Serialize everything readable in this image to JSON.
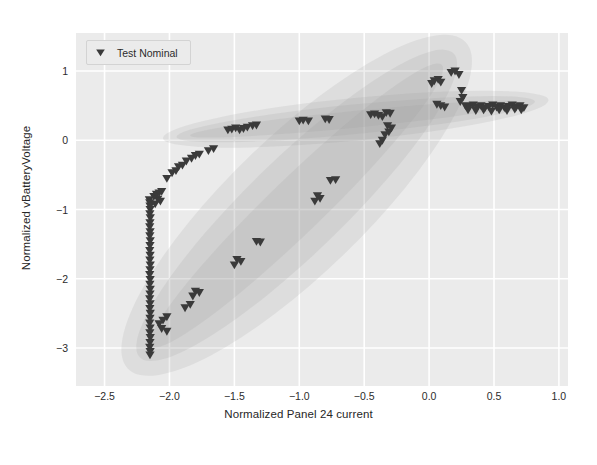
{
  "figure": {
    "background": "#ffffff",
    "plot_background": "#ebebeb",
    "grid_color": "#ffffff",
    "marker_color": "#3a3a3a",
    "band_color": "#9a9a9a"
  },
  "legend": {
    "position": "upper-left",
    "entries": [
      {
        "label": "Test Nominal",
        "marker": "triangle-down-marker",
        "color": "#3a3a3a"
      }
    ]
  },
  "chart_data": {
    "type": "scatter",
    "title": "",
    "xlabel": "Normalized Panel 24 current",
    "ylabel": "Normalized vBatteryVoltage",
    "xlim": [
      -2.72,
      1.07
    ],
    "ylim": [
      -3.55,
      1.55
    ],
    "xticks": [
      -2.5,
      -2.0,
      -1.5,
      -1.0,
      -0.5,
      0.0,
      0.5,
      1.0
    ],
    "xticklabels": [
      "-2.5",
      "-2.0",
      "-1.5",
      "-1.0",
      "-0.5",
      "0.0",
      "0.5",
      "1.0"
    ],
    "yticks": [
      1,
      0,
      -1,
      -2,
      -3
    ],
    "yticklabels": [
      "1",
      "0",
      "-1",
      "-2",
      "-3"
    ],
    "grid": true,
    "legend_position": "upper left",
    "series": [
      {
        "name": "Test Nominal",
        "marker": "triangle-down",
        "color": "#3a3a3a",
        "points": [
          [
            -2.155,
            -0.86
          ],
          [
            -2.152,
            -0.9
          ],
          [
            -2.15,
            -0.95
          ],
          [
            -2.149,
            -1.0
          ],
          [
            -2.151,
            -1.06
          ],
          [
            -2.148,
            -1.12
          ],
          [
            -2.15,
            -1.19
          ],
          [
            -2.152,
            -1.25
          ],
          [
            -2.149,
            -1.32
          ],
          [
            -2.151,
            -1.38
          ],
          [
            -2.148,
            -1.45
          ],
          [
            -2.15,
            -1.52
          ],
          [
            -2.152,
            -1.59
          ],
          [
            -2.149,
            -1.66
          ],
          [
            -2.151,
            -1.73
          ],
          [
            -2.148,
            -1.8
          ],
          [
            -2.15,
            -1.87
          ],
          [
            -2.152,
            -1.94
          ],
          [
            -2.149,
            -2.01
          ],
          [
            -2.151,
            -2.08
          ],
          [
            -2.148,
            -2.15
          ],
          [
            -2.15,
            -2.22
          ],
          [
            -2.152,
            -2.29
          ],
          [
            -2.149,
            -2.36
          ],
          [
            -2.151,
            -2.43
          ],
          [
            -2.148,
            -2.5
          ],
          [
            -2.15,
            -2.57
          ],
          [
            -2.152,
            -2.64
          ],
          [
            -2.149,
            -2.71
          ],
          [
            -2.151,
            -2.78
          ],
          [
            -2.148,
            -2.85
          ],
          [
            -2.15,
            -2.92
          ],
          [
            -2.152,
            -2.99
          ],
          [
            -2.149,
            -3.05
          ],
          [
            -2.15,
            -3.1
          ],
          [
            -2.12,
            -0.81
          ],
          [
            -2.1,
            -0.78
          ],
          [
            -2.08,
            -0.76
          ],
          [
            -2.06,
            -0.74
          ],
          [
            -2.09,
            -0.85
          ],
          [
            -2.07,
            -0.88
          ],
          [
            -2.11,
            -0.92
          ],
          [
            -2.02,
            -0.55
          ],
          [
            -1.98,
            -0.47
          ],
          [
            -1.95,
            -0.44
          ],
          [
            -1.93,
            -0.38
          ],
          [
            -1.9,
            -0.36
          ],
          [
            -1.87,
            -0.3
          ],
          [
            -1.83,
            -0.26
          ],
          [
            -1.8,
            -0.22
          ],
          [
            -1.77,
            -0.2
          ],
          [
            -1.7,
            -0.15
          ],
          [
            -1.66,
            -0.12
          ],
          [
            -1.55,
            0.15
          ],
          [
            -1.52,
            0.16
          ],
          [
            -1.49,
            0.18
          ],
          [
            -1.46,
            0.15
          ],
          [
            -1.43,
            0.17
          ],
          [
            -1.4,
            0.19
          ],
          [
            -1.36,
            0.21
          ],
          [
            -1.33,
            0.22
          ],
          [
            -1.0,
            0.28
          ],
          [
            -0.97,
            0.29
          ],
          [
            -0.93,
            0.28
          ],
          [
            -0.8,
            0.31
          ],
          [
            -0.77,
            0.3
          ],
          [
            -0.45,
            0.37
          ],
          [
            -0.42,
            0.38
          ],
          [
            -0.39,
            0.36
          ],
          [
            -0.36,
            0.34
          ],
          [
            -0.33,
            0.4
          ],
          [
            -0.3,
            0.39
          ],
          [
            -0.32,
            0.21
          ],
          [
            -0.29,
            0.18
          ],
          [
            -0.31,
            0.12
          ],
          [
            -0.34,
            0.08
          ],
          [
            -0.36,
            0.0
          ],
          [
            -0.38,
            -0.05
          ],
          [
            -0.86,
            -0.8
          ],
          [
            -0.84,
            -0.84
          ],
          [
            -0.88,
            -0.88
          ],
          [
            -0.76,
            -0.58
          ],
          [
            -0.72,
            -0.57
          ],
          [
            -1.33,
            -1.46
          ],
          [
            -1.3,
            -1.47
          ],
          [
            -1.48,
            -1.72
          ],
          [
            -1.45,
            -1.75
          ],
          [
            -1.5,
            -1.8
          ],
          [
            -1.8,
            -2.18
          ],
          [
            -1.77,
            -2.2
          ],
          [
            -1.82,
            -2.25
          ],
          [
            -1.84,
            -2.37
          ],
          [
            -1.88,
            -2.42
          ],
          [
            -2.02,
            -2.55
          ],
          [
            -2.05,
            -2.6
          ],
          [
            -2.08,
            -2.65
          ],
          [
            -2.06,
            -2.72
          ],
          [
            -2.02,
            -2.76
          ],
          [
            0.04,
            0.86
          ],
          [
            0.07,
            0.88
          ],
          [
            0.02,
            0.82
          ],
          [
            0.09,
            0.84
          ],
          [
            0.17,
            0.98
          ],
          [
            0.2,
            1.0
          ],
          [
            0.23,
            0.95
          ],
          [
            0.25,
            0.72
          ],
          [
            0.26,
            0.62
          ],
          [
            0.24,
            0.56
          ],
          [
            0.06,
            0.52
          ],
          [
            0.09,
            0.5
          ],
          [
            0.12,
            0.48
          ],
          [
            0.28,
            0.5
          ],
          [
            0.31,
            0.49
          ],
          [
            0.34,
            0.51
          ],
          [
            0.37,
            0.48
          ],
          [
            0.4,
            0.5
          ],
          [
            0.43,
            0.47
          ],
          [
            0.46,
            0.49
          ],
          [
            0.49,
            0.51
          ],
          [
            0.52,
            0.48
          ],
          [
            0.55,
            0.5
          ],
          [
            0.58,
            0.47
          ],
          [
            0.61,
            0.49
          ],
          [
            0.64,
            0.51
          ],
          [
            0.67,
            0.48
          ],
          [
            0.7,
            0.5
          ],
          [
            0.73,
            0.47
          ],
          [
            0.3,
            0.44
          ],
          [
            0.36,
            0.43
          ],
          [
            0.42,
            0.44
          ],
          [
            0.48,
            0.42
          ],
          [
            0.54,
            0.44
          ],
          [
            0.6,
            0.43
          ],
          [
            0.66,
            0.45
          ],
          [
            0.71,
            0.44
          ]
        ]
      }
    ],
    "confidence_bands": [
      {
        "name": "shallow-trend-band",
        "description": "narrow shaded band rising gently from left to right",
        "x_start": -2.05,
        "y_start": 0.03,
        "x_end": 0.92,
        "y_end": 0.58
      },
      {
        "name": "steep-trend-band",
        "description": "broad shaded ellipse rising steeply from lower-left to upper-right",
        "x_start": -2.32,
        "y_start": -3.3,
        "x_end": 0.28,
        "y_end": 1.42
      }
    ]
  }
}
